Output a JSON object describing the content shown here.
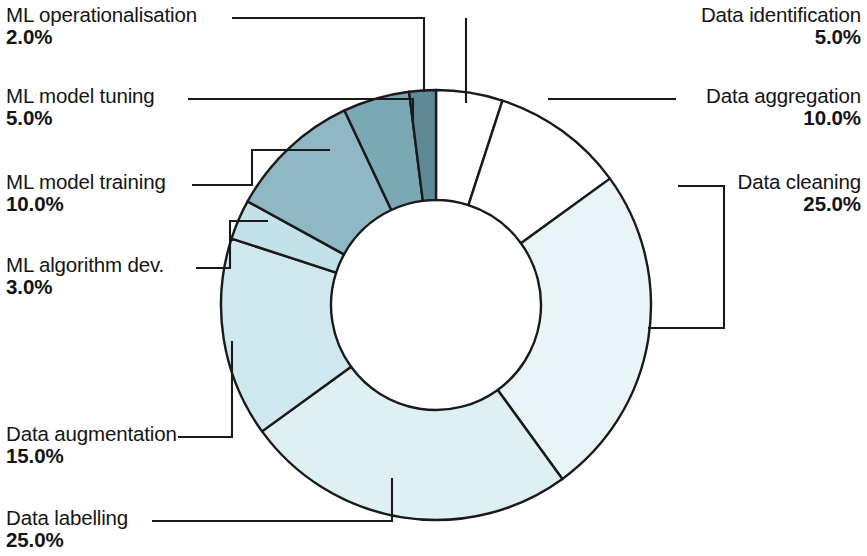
{
  "chart_data": {
    "type": "pie",
    "variant": "donut",
    "title": "",
    "subtitle": "",
    "xlabel": "",
    "ylabel": "",
    "legend_position": "none",
    "labels_show_percent": true,
    "grid": false,
    "start_angle_deg": 0,
    "direction": "clockwise",
    "categories": [
      "Data identification",
      "Data aggregation",
      "Data cleaning",
      "Data labelling",
      "Data augmentation",
      "ML algorithm dev.",
      "ML model training",
      "ML model tuning",
      "ML operationalisation"
    ],
    "values": [
      5.0,
      10.0,
      25.0,
      25.0,
      15.0,
      3.0,
      10.0,
      5.0,
      2.0
    ],
    "value_labels": [
      "5.0%",
      "10.0%",
      "25.0%",
      "25.0%",
      "15.0%",
      "3.0%",
      "10.0%",
      "5.0%",
      "2.0%"
    ],
    "colors": [
      "#ffffff",
      "#ffffff",
      "#e9f4f6",
      "#dff0f3",
      "#cfe7ee",
      "#c3e1e9",
      "#8fb8c4",
      "#7aa8b4",
      "#5e8a96"
    ],
    "stroke_color": "#1a1a1a",
    "total": 100.0
  },
  "chart": {
    "segments": [
      {
        "name": "Data identification",
        "value": "5.0%",
        "color": "#ffffff"
      },
      {
        "name": "Data aggregation",
        "value": "10.0%",
        "color": "#ffffff"
      },
      {
        "name": "Data cleaning",
        "value": "25.0%",
        "color": "#e9f4f6"
      },
      {
        "name": "Data labelling",
        "value": "25.0%",
        "color": "#dff0f3"
      },
      {
        "name": "Data augmentation",
        "value": "15.0%",
        "color": "#cfe7ee"
      },
      {
        "name": "ML algorithm dev.",
        "value": "3.0%",
        "color": "#c3e1e9"
      },
      {
        "name": "ML model training",
        "value": "10.0%",
        "color": "#8fb8c4"
      },
      {
        "name": "ML model tuning",
        "value": "5.0%",
        "color": "#7aa8b4"
      },
      {
        "name": "ML operationalisation",
        "value": "2.0%",
        "color": "#5e8a96"
      }
    ]
  },
  "labels": {
    "ml_operationalisation": {
      "name": "ML operationalisation",
      "value": "2.0%"
    },
    "ml_model_tuning": {
      "name": "ML model tuning",
      "value": "5.0%"
    },
    "ml_model_training": {
      "name": "ML model training",
      "value": "10.0%"
    },
    "ml_algorithm_dev": {
      "name": "ML algorithm dev.",
      "value": "3.0%"
    },
    "data_augmentation": {
      "name": "Data augmentation",
      "value": "15.0%"
    },
    "data_labelling": {
      "name": "Data labelling",
      "value": "25.0%"
    },
    "data_identification": {
      "name": "Data identification",
      "value": "5.0%"
    },
    "data_aggregation": {
      "name": "Data aggregation",
      "value": "10.0%"
    },
    "data_cleaning": {
      "name": "Data cleaning",
      "value": "25.0%"
    }
  }
}
